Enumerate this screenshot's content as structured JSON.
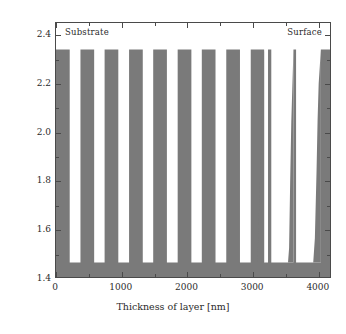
{
  "chart_data": {
    "type": "area",
    "title": "",
    "xlabel": "Thickness of layer [nm]",
    "ylabel": "Index of refraction",
    "xlim": [
      0,
      4200
    ],
    "ylim": [
      1.4,
      2.45
    ],
    "grid": false,
    "legend": null,
    "xticks": [
      0,
      1000,
      2000,
      3000,
      4000
    ],
    "xticklabels": [
      "0",
      "1000",
      "2000",
      "3000",
      "4000"
    ],
    "xminorticks": [
      500,
      1500,
      2500,
      3500
    ],
    "yticks": [
      1.4,
      1.6,
      1.8,
      2.0,
      2.2,
      2.4
    ],
    "yticklabels": [
      "1.4",
      "1.6",
      "1.8",
      "2.0",
      "2.2",
      "2.4"
    ],
    "yminorticks": [
      1.5,
      1.7,
      1.9,
      2.1,
      2.3
    ],
    "series_name": "refractive index profile",
    "high_index": 2.34,
    "low_index": 1.46,
    "baseline": 1.4,
    "fill_color": "#7a7a7a",
    "annotations": [
      {
        "text": "Substrate",
        "x": 250,
        "y": 2.42,
        "align": "left"
      },
      {
        "text": "Surface",
        "x": 3950,
        "y": 2.42,
        "align": "right"
      }
    ],
    "layers": [
      {
        "x0": 0,
        "x1": 210,
        "n": 2.34
      },
      {
        "x0": 210,
        "x1": 375,
        "n": 1.46
      },
      {
        "x0": 375,
        "x1": 585,
        "n": 2.34
      },
      {
        "x0": 585,
        "x1": 745,
        "n": 1.46
      },
      {
        "x0": 745,
        "x1": 955,
        "n": 2.34
      },
      {
        "x0": 955,
        "x1": 1120,
        "n": 1.46
      },
      {
        "x0": 1120,
        "x1": 1330,
        "n": 2.34
      },
      {
        "x0": 1330,
        "x1": 1490,
        "n": 1.46
      },
      {
        "x0": 1490,
        "x1": 1700,
        "n": 2.34
      },
      {
        "x0": 1700,
        "x1": 1865,
        "n": 1.46
      },
      {
        "x0": 1865,
        "x1": 2075,
        "n": 2.34
      },
      {
        "x0": 2075,
        "x1": 2235,
        "n": 1.46
      },
      {
        "x0": 2235,
        "x1": 2445,
        "n": 2.34
      },
      {
        "x0": 2445,
        "x1": 2610,
        "n": 1.46
      },
      {
        "x0": 2610,
        "x1": 2820,
        "n": 2.34
      },
      {
        "x0": 2820,
        "x1": 2985,
        "n": 1.46
      },
      {
        "x0": 2985,
        "x1": 3190,
        "n": 2.34
      },
      {
        "x0": 3190,
        "x1": 3250,
        "n": 1.46
      },
      {
        "x0": 3250,
        "x1": 3300,
        "n": 2.34
      },
      {
        "x0": 3300,
        "x1": 3640,
        "n": 1.46
      },
      {
        "x0": 3640,
        "x1": 3680,
        "n": 2.34
      },
      {
        "x0": 3680,
        "x1": 4060,
        "n": 1.46
      },
      {
        "x0": 4060,
        "x1": 4200,
        "n": 2.34
      }
    ],
    "graded_profile_note": "Layers beyond ~3200 nm are tapered: their high-index width narrows in discrete steps with increasing index value."
  },
  "axes": {
    "y_title": "Index of refraction",
    "x_title": "Thickness of layer [nm]"
  },
  "annotations": {
    "substrate": "Substrate",
    "surface": "Surface"
  },
  "ticks": {
    "y": [
      "2.4",
      "2.2",
      "2.0",
      "1.8",
      "1.6",
      "1.4"
    ],
    "x": [
      "0",
      "1000",
      "2000",
      "3000",
      "4000"
    ]
  }
}
